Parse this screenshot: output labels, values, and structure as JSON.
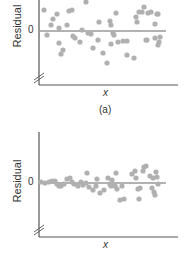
{
  "chart_data": [
    {
      "type": "scatter",
      "panel": "(a)",
      "xlabel": "x",
      "ylabel": "Residual",
      "yticks": [
        "0"
      ],
      "grid": false,
      "reference_line": 0,
      "axis_break": true,
      "points": [
        [
          44,
          10
        ],
        [
          47,
          35
        ],
        [
          51,
          25
        ],
        [
          53,
          19
        ],
        [
          57,
          14
        ],
        [
          59,
          28
        ],
        [
          59,
          43
        ],
        [
          61,
          54
        ],
        [
          63,
          50
        ],
        [
          67,
          25
        ],
        [
          69,
          11
        ],
        [
          72,
          10
        ],
        [
          73,
          36
        ],
        [
          75,
          38
        ],
        [
          80,
          42
        ],
        [
          82,
          30
        ],
        [
          86,
          2
        ],
        [
          88,
          33
        ],
        [
          91,
          34
        ],
        [
          93,
          48
        ],
        [
          98,
          40
        ],
        [
          99,
          22
        ],
        [
          103,
          53
        ],
        [
          107,
          63
        ],
        [
          110,
          21
        ],
        [
          111,
          25
        ],
        [
          111,
          44
        ],
        [
          113,
          33
        ],
        [
          114,
          35
        ],
        [
          116,
          13
        ],
        [
          118,
          42
        ],
        [
          123,
          41
        ],
        [
          127,
          55
        ],
        [
          127,
          41
        ],
        [
          134,
          58
        ],
        [
          136,
          17
        ],
        [
          137,
          22
        ],
        [
          139,
          12
        ],
        [
          142,
          12
        ],
        [
          144,
          7
        ],
        [
          146,
          40
        ],
        [
          147,
          40
        ],
        [
          148,
          13
        ],
        [
          151,
          12
        ],
        [
          155,
          38
        ],
        [
          155,
          24
        ],
        [
          158,
          14
        ],
        [
          159,
          42
        ],
        [
          160,
          37
        ],
        [
          158,
          45
        ],
        [
          157,
          14
        ]
      ],
      "color": "#b0b0b0"
    },
    {
      "type": "scatter",
      "panel": "(b)",
      "xlabel": "x",
      "ylabel": "Residual",
      "yticks": [
        "0"
      ],
      "grid": false,
      "reference_line": 0,
      "axis_break": true,
      "points": [
        [
          41,
          182
        ],
        [
          45,
          183
        ],
        [
          49,
          182
        ],
        [
          52,
          181
        ],
        [
          55,
          181
        ],
        [
          57,
          184
        ],
        [
          59,
          186
        ],
        [
          61,
          186
        ],
        [
          64,
          184
        ],
        [
          67,
          179
        ],
        [
          70,
          178
        ],
        [
          72,
          182
        ],
        [
          74,
          184
        ],
        [
          78,
          186
        ],
        [
          81,
          182
        ],
        [
          83,
          185
        ],
        [
          86,
          183
        ],
        [
          87,
          173
        ],
        [
          89,
          187
        ],
        [
          93,
          190
        ],
        [
          96,
          186
        ],
        [
          97,
          179
        ],
        [
          100,
          193
        ],
        [
          104,
          190
        ],
        [
          108,
          178
        ],
        [
          110,
          184
        ],
        [
          111,
          186
        ],
        [
          112,
          180
        ],
        [
          115,
          186
        ],
        [
          116,
          173
        ],
        [
          117,
          189
        ],
        [
          120,
          200
        ],
        [
          122,
          186
        ],
        [
          124,
          199
        ],
        [
          132,
          174
        ],
        [
          135,
          171
        ],
        [
          136,
          178
        ],
        [
          138,
          189
        ],
        [
          139,
          199
        ],
        [
          140,
          188
        ],
        [
          143,
          171
        ],
        [
          144,
          167
        ],
        [
          146,
          166
        ],
        [
          150,
          176
        ],
        [
          152,
          188
        ],
        [
          153,
          178
        ],
        [
          154,
          192
        ],
        [
          155,
          195
        ],
        [
          156,
          172
        ],
        [
          157,
          177
        ],
        [
          158,
          184
        ]
      ],
      "color": "#b0b0b0"
    }
  ],
  "labels": {
    "panel_a_ylabel": "Residual",
    "panel_a_zero": "0",
    "panel_a_xlabel": "x",
    "panel_a_caption": "(a)",
    "panel_b_ylabel": "Residual",
    "panel_b_zero": "0",
    "panel_b_xlabel": "x"
  }
}
